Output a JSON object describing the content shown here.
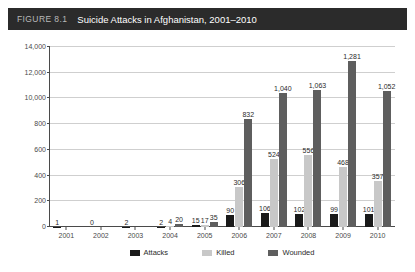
{
  "header": {
    "figure_number": "FIGURE 8.1",
    "title": "Suicide Attacks in Afghanistan, 2001–2010",
    "bar_color": "#2b2b2b"
  },
  "legend": {
    "position": "bottom-center",
    "items": [
      {
        "label": "Attacks",
        "color": "#1a1a1a",
        "icon": "square-swatch-icon"
      },
      {
        "label": "Killed",
        "color": "#c8c8c8",
        "icon": "square-swatch-icon"
      },
      {
        "label": "Wounded",
        "color": "#5e5e5e",
        "icon": "square-swatch-icon"
      }
    ]
  },
  "chart_data": {
    "type": "bar",
    "title": "Suicide Attacks in Afghanistan, 2001–2010",
    "xlabel": "",
    "ylabel": "",
    "grid": true,
    "legend_position": "bottom-center",
    "categories": [
      "2001",
      "2002",
      "2003",
      "2004",
      "2005",
      "2006",
      "2007",
      "2008",
      "2009",
      "2010"
    ],
    "ytick_labels": [
      "0",
      "200",
      "400",
      "600",
      "800",
      "10,000",
      "12,000",
      "14,000"
    ],
    "ytick_values": [
      0,
      200,
      400,
      600,
      800,
      1000,
      1200,
      1400
    ],
    "ylim": [
      0,
      1400
    ],
    "series": [
      {
        "name": "Attacks",
        "color": "#1a1a1a",
        "values": [
          1,
          0,
          2,
          2,
          15,
          90,
          106,
          102,
          99,
          101
        ],
        "value_labels": [
          "1",
          "0",
          "2",
          "2",
          "15",
          "90",
          "106",
          "102",
          "99",
          "101"
        ]
      },
      {
        "name": "Killed",
        "color": "#c8c8c8",
        "values": [
          0,
          0,
          0,
          4,
          17,
          306,
          524,
          556,
          468,
          357
        ],
        "value_labels": [
          "",
          "",
          "",
          "4",
          "17",
          "306",
          "524",
          "556",
          "468",
          "357"
        ]
      },
      {
        "name": "Wounded",
        "color": "#5e5e5e",
        "values": [
          0,
          0,
          0,
          20,
          35,
          832,
          1040,
          1063,
          1281,
          1052
        ],
        "value_labels": [
          "",
          "",
          "",
          "20",
          "35",
          "832",
          "1,040",
          "1,063",
          "1,281",
          "1,052"
        ]
      }
    ]
  }
}
